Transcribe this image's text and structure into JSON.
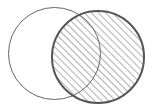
{
  "diagram": {
    "type": "venn",
    "sets": [
      {
        "id": "A",
        "cx": 54.5,
        "cy": 53.5,
        "r": 46,
        "fill": "none",
        "stroke": "#666666",
        "stroke_width": 1,
        "shaded": false
      },
      {
        "id": "B",
        "cx": 98,
        "cy": 57,
        "r": 46,
        "fill": "hatch",
        "stroke": "#555555",
        "stroke_width": 2,
        "shaded": true
      }
    ],
    "shaded_region": "B",
    "hatch": {
      "angle": 45,
      "spacing": 5,
      "color": "#7a7a7a",
      "width": 1.2
    },
    "background": "#ffffff"
  }
}
